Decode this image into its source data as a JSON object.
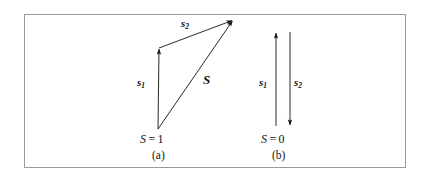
{
  "figure": {
    "background_color": "#ffffff",
    "frame_color": "#9a9a9a",
    "ink_color": "#121212",
    "panels": [
      {
        "id": "a",
        "panel_label": "(a)",
        "state_symbol": "S",
        "state_equals": "=",
        "state_value": "1",
        "state_label": "S = 1",
        "description": "triplet-state-vector-addition",
        "vectors": [
          {
            "name": "s1",
            "label_base": "s",
            "label_sub": "1",
            "x1": 158,
            "y1": 129,
            "x2": 159,
            "y2": 48,
            "label_x": 139,
            "label_y": 83
          },
          {
            "name": "s2",
            "label_base": "s",
            "label_sub": "2",
            "x1": 159,
            "y1": 48,
            "x2": 233,
            "y2": 20,
            "label_x": 183,
            "label_y": 24
          },
          {
            "name": "S",
            "label_base": "S",
            "label_sub": "",
            "x1": 158,
            "y1": 129,
            "x2": 233,
            "y2": 20,
            "label_x": 205,
            "label_y": 80
          }
        ]
      },
      {
        "id": "b",
        "panel_label": "(b)",
        "state_symbol": "S",
        "state_equals": "=",
        "state_value": "0",
        "state_label": "S = 0",
        "description": "singlet-state-antiparallel-spins",
        "vectors": [
          {
            "name": "s1",
            "label_base": "s",
            "label_sub": "1",
            "x1": 276,
            "y1": 126,
            "x2": 276,
            "y2": 32,
            "label_x": 262,
            "label_y": 83
          },
          {
            "name": "s2",
            "label_base": "s",
            "label_sub": "2",
            "x1": 290,
            "y1": 32,
            "x2": 290,
            "y2": 126,
            "label_x": 296,
            "label_y": 83
          }
        ]
      }
    ]
  }
}
